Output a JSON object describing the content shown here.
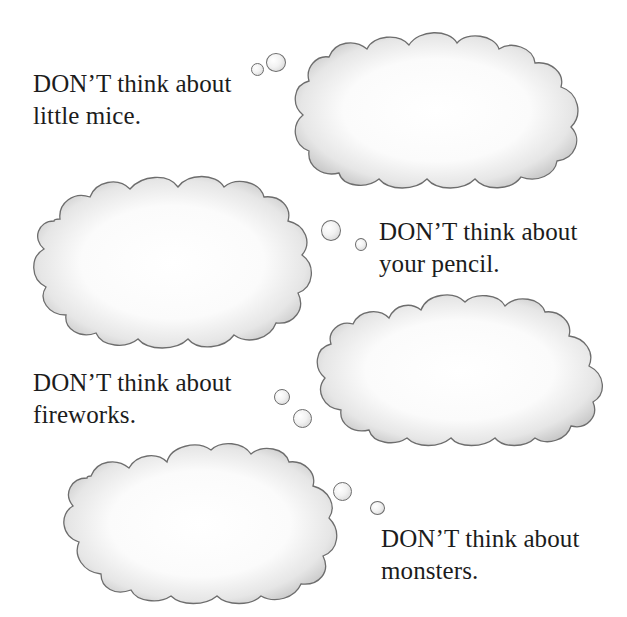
{
  "page": {
    "background": "#ffffff",
    "text_color": "#1c1c1c",
    "cloud_outline_color": "#6d6d6d",
    "cloud_shade_color": "#bdbdbd"
  },
  "captions": [
    {
      "line1": "DON’T think about",
      "line2": "little mice."
    },
    {
      "line1": "DON’T think about",
      "line2": "your pencil."
    },
    {
      "line1": "DON’T think about",
      "line2": "fireworks."
    },
    {
      "line1": "DON’T think about",
      "line2": "monsters."
    }
  ],
  "clouds": [
    {
      "name": "thought-cloud-little-mice",
      "content": ""
    },
    {
      "name": "thought-cloud-your-pencil",
      "content": ""
    },
    {
      "name": "thought-cloud-fireworks",
      "content": ""
    },
    {
      "name": "thought-cloud-monsters",
      "content": ""
    }
  ]
}
